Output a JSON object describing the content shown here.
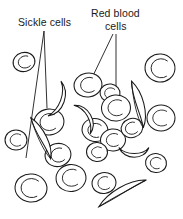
{
  "figure": {
    "background_color": "#ffffff",
    "stroke_color": "#1a1a1a",
    "labels": {
      "sickle_cells": "Sickle cells",
      "red_blood_line1": "Red blood",
      "red_blood_line2": "cells"
    },
    "cells": {
      "normal_label": "normal red blood cell",
      "sickle_label": "sickle cell",
      "normal_count": 17,
      "sickle_count": 6
    }
  }
}
